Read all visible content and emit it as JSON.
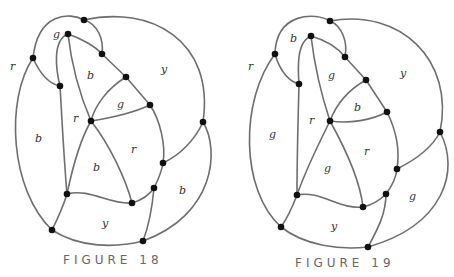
{
  "figures": [
    {
      "caption": "FIGURE 18",
      "region_labels": [
        {
          "text": "g",
          "x": 56,
          "y": 38
        },
        {
          "text": "r",
          "x": 12,
          "y": 70
        },
        {
          "text": "b",
          "x": 90,
          "y": 79
        },
        {
          "text": "y",
          "x": 164,
          "y": 73
        },
        {
          "text": "g",
          "x": 120,
          "y": 108
        },
        {
          "text": "r",
          "x": 75,
          "y": 122
        },
        {
          "text": "b",
          "x": 38,
          "y": 142
        },
        {
          "text": "r",
          "x": 134,
          "y": 153
        },
        {
          "text": "b",
          "x": 96,
          "y": 171
        },
        {
          "text": "b",
          "x": 182,
          "y": 194
        },
        {
          "text": "y",
          "x": 105,
          "y": 227
        }
      ]
    },
    {
      "caption": "FIGURE 19",
      "region_labels": [
        {
          "text": "b",
          "x": 293,
          "y": 42
        },
        {
          "text": "r",
          "x": 250,
          "y": 70
        },
        {
          "text": "g",
          "x": 331,
          "y": 79
        },
        {
          "text": "y",
          "x": 403,
          "y": 77
        },
        {
          "text": "b",
          "x": 357,
          "y": 111
        },
        {
          "text": "r",
          "x": 311,
          "y": 124
        },
        {
          "text": "g",
          "x": 272,
          "y": 138
        },
        {
          "text": "r",
          "x": 367,
          "y": 155
        },
        {
          "text": "g",
          "x": 327,
          "y": 172
        },
        {
          "text": "g",
          "x": 412,
          "y": 200
        },
        {
          "text": "y",
          "x": 334,
          "y": 230
        }
      ]
    }
  ]
}
